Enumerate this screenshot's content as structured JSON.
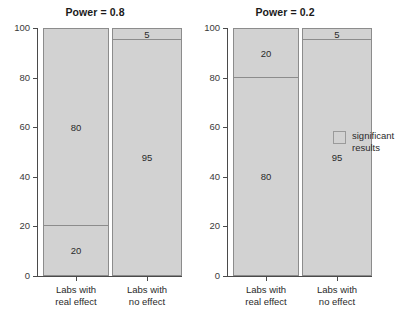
{
  "chart_data": {
    "type": "bar",
    "subtype": "stacked-bar-grid",
    "title": "",
    "xlabel": "",
    "ylabel": "",
    "ylim": [
      0,
      100
    ],
    "yticks": [
      0,
      20,
      40,
      60,
      80,
      100
    ],
    "ytick_labels": [
      "0",
      "20",
      "40",
      "60",
      "80",
      "100"
    ],
    "grid": false,
    "legend_position": "right",
    "legend": [
      {
        "label": "significant\nresults",
        "color": "#d2d2d2"
      }
    ],
    "categories": [
      "Labs with\nreal effect",
      "Labs with\nno effect"
    ],
    "panels": [
      {
        "title": "Power = 0.8",
        "bars": [
          {
            "category": "Labs with\nreal effect",
            "segments": [
              {
                "name": "non-significant",
                "value": 80,
                "label": "80",
                "from": 20,
                "to": 100
              },
              {
                "name": "significant",
                "value": 20,
                "label": "20",
                "from": 0,
                "to": 20
              }
            ]
          },
          {
            "category": "Labs with\nno effect",
            "segments": [
              {
                "name": "significant",
                "value": 5,
                "label": "5",
                "from": 95,
                "to": 100
              },
              {
                "name": "non-significant",
                "value": 95,
                "label": "95",
                "from": 0,
                "to": 95
              }
            ]
          }
        ]
      },
      {
        "title": "Power = 0.2",
        "bars": [
          {
            "category": "Labs with\nreal effect",
            "segments": [
              {
                "name": "non-significant",
                "value": 20,
                "label": "20",
                "from": 80,
                "to": 100
              },
              {
                "name": "significant",
                "value": 80,
                "label": "80",
                "from": 0,
                "to": 80
              }
            ]
          },
          {
            "category": "Labs with\nno effect",
            "segments": [
              {
                "name": "significant",
                "value": 5,
                "label": "5",
                "from": 95,
                "to": 100
              },
              {
                "name": "non-significant",
                "value": 95,
                "label": "95",
                "from": 0,
                "to": 95
              }
            ]
          }
        ]
      }
    ],
    "colors": {
      "bar_fill": "#d2d2d2",
      "bar_border": "#8c8c8c",
      "axis": "#4a4a4a",
      "text": "#2a2a2a",
      "background": "#ffffff"
    }
  }
}
